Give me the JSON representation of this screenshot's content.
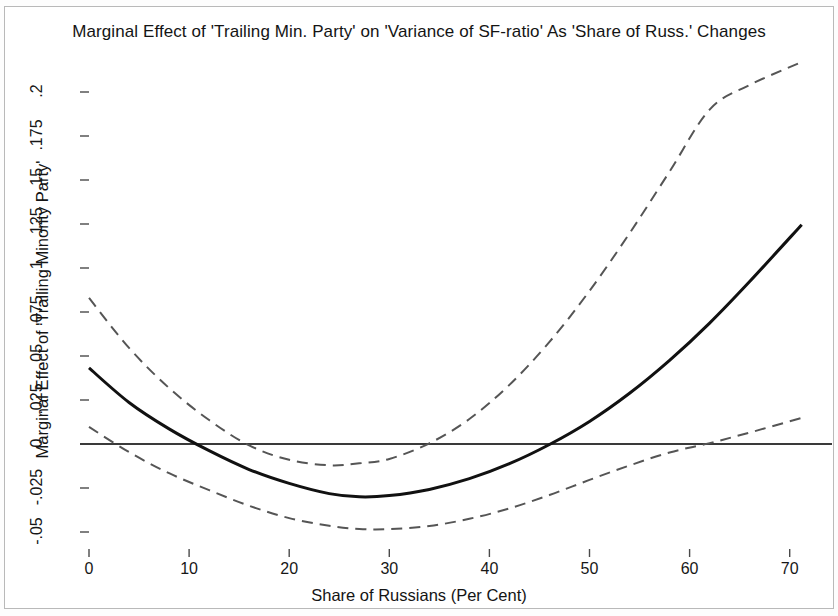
{
  "chart_title": "Marginal Effect of 'Trailing Min. Party' on 'Variance of SF-ratio' As 'Share of Russ.' Changes",
  "axes": {
    "x_title": "Share of Russians (Per Cent)",
    "y_title": "Marginal Effect of 'Trailing Minority Party'"
  },
  "chart_data": {
    "type": "line",
    "title": "Marginal Effect of 'Trailing Min. Party' on 'Variance of SF-ratio' As 'Share of Russ.' Changes",
    "xlabel": "Share of Russians (Per Cent)",
    "ylabel": "Marginal Effect of 'Trailing Minority Party'",
    "xlim": [
      -1.5,
      74.5
    ],
    "ylim": [
      -0.0615,
      0.225
    ],
    "grid": false,
    "legend": null,
    "xticks": [
      0,
      10,
      20,
      30,
      40,
      50,
      60,
      70
    ],
    "xticklabels": [
      "0",
      "10",
      "20",
      "30",
      "40",
      "50",
      "60",
      "70"
    ],
    "yticks": [
      -0.05,
      -0.025,
      0,
      0.025,
      0.05,
      0.075,
      0.1,
      0.125,
      0.15,
      0.175,
      0.2
    ],
    "yticklabels": [
      "-.05",
      "-.025",
      "0",
      ".025",
      ".05",
      ".075",
      ".1",
      ".125",
      ".15",
      ".175",
      ".2"
    ],
    "x_domain": [
      0,
      71.2
    ],
    "series": [
      {
        "name": "Marginal effect",
        "style": "solid",
        "color": "#111111",
        "linewidth": 3,
        "x": [
          0,
          4,
          8,
          12,
          16,
          20,
          24,
          27,
          30,
          34,
          38,
          42,
          46,
          50,
          54,
          58,
          62,
          66,
          71.2
        ],
        "values": [
          0.0432,
          0.0236,
          0.0086,
          -0.0038,
          -0.0145,
          -0.0224,
          -0.0282,
          -0.03,
          -0.0293,
          -0.0258,
          -0.0197,
          -0.0112,
          -0.0003,
          0.0128,
          0.0288,
          0.0475,
          0.0687,
          0.0923,
          0.1246
        ]
      },
      {
        "name": "Upper 95% confidence bound",
        "style": "dashed",
        "color": "#555555",
        "linewidth": 2,
        "x": [
          0,
          4,
          8,
          12,
          16,
          20,
          24,
          27,
          30,
          34,
          38,
          42,
          46,
          50,
          54,
          58,
          62,
          66,
          71.2
        ],
        "values": [
          0.083,
          0.0546,
          0.0318,
          0.0136,
          -0.0008,
          -0.009,
          -0.0121,
          -0.011,
          -0.0085,
          0.0004,
          0.0142,
          0.0336,
          0.058,
          0.087,
          0.1197,
          0.1548,
          0.19,
          0.204,
          0.217
        ]
      },
      {
        "name": "Lower 95% confidence bound",
        "style": "dashed",
        "color": "#555555",
        "linewidth": 2,
        "x": [
          0,
          4,
          8,
          12,
          16,
          20,
          24,
          27,
          30,
          34,
          38,
          42,
          46,
          50,
          54,
          58,
          62,
          66,
          71.2
        ],
        "values": [
          0.0097,
          -0.0046,
          -0.0166,
          -0.0262,
          -0.0351,
          -0.0421,
          -0.0465,
          -0.0483,
          -0.0484,
          -0.0466,
          -0.0425,
          -0.0366,
          -0.029,
          -0.0204,
          -0.0122,
          -0.0048,
          0.0005,
          0.0065,
          0.0148
        ]
      }
    ],
    "reference_lines": [
      {
        "name": "zero-line",
        "orientation": "horizontal",
        "value": 0,
        "style": "solid",
        "color": "#3a3a3a"
      }
    ],
    "annotations": {
      "zero_crossing_effect": 7.3,
      "zero_crossing_upper_bound": 13.6,
      "zero_crossing_upper_bound_2": 39.3,
      "zero_crossing_effect_2": 48.8,
      "zero_crossing_lower_bound": 61.5
    }
  }
}
